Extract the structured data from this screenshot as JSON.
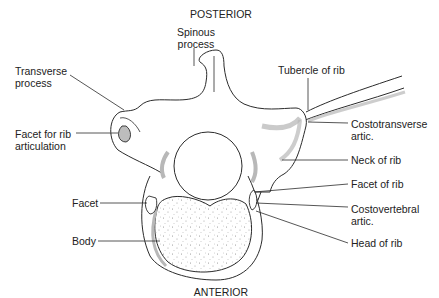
{
  "diagram": {
    "orientation": {
      "top": "POSTERIOR",
      "bottom": "ANTERIOR"
    },
    "labels": {
      "spinous_process": "Spinous\nprocess",
      "transverse_process": "Transverse\nprocess",
      "facet_rib_articulation": "Facet for rib\narticulation",
      "facet": "Facet",
      "body": "Body",
      "tubercle_of_rib": "Tubercle of rib",
      "costotransverse_artic": "Costotransverse\nartic.",
      "neck_of_rib": "Neck of rib",
      "facet_of_rib": "Facet of rib",
      "costovertebral_artic": "Costovertebral\nartic.",
      "head_of_rib": "Head of rib"
    },
    "colors": {
      "line": "#2b2b2b",
      "shade": "#b8b8b8",
      "stipple": "#8a8a8a",
      "background": "#ffffff"
    }
  }
}
